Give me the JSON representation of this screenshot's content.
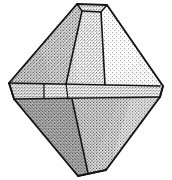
{
  "figure": {
    "title": "Octahedral crystal",
    "caption": "",
    "medium": "engraving",
    "background_color": "#ffffff",
    "ink_color": "#1a1a1a",
    "canvas": {
      "width": 172,
      "height": 180
    }
  },
  "geometry": {
    "description": "Truncated octahedral (bipyramidal) crystal drawn in perspective with a horizontal girdle band.",
    "outline_points": "77,4 107,5 163,86 160,97 106,170 78,176 14,99 9,83",
    "girdle_top_line": "9,83 160,86",
    "girdle_bottom_line": "14,99 160,97",
    "apex_face": "77,4 107,5 101,12 82,11",
    "left_vertex_face": "9,83 14,99",
    "right_vertex_face": "163,86 160,97",
    "bottom_vertex_face": "78,176 106,170",
    "upper_left_edge": "9,83 77,4",
    "upper_right_edge": "107,5 163,86",
    "lower_left_edge": "14,99 78,176",
    "lower_right_edge": "160,97 106,170",
    "upper_ridge_left": "82,11 66,84",
    "upper_ridge_right": "101,12 105,85",
    "lower_ridge_center": "72,99 88,173",
    "inner_left_column": "44,84 44,98"
  },
  "shading": {
    "upper_left_facet": {
      "name": "upper-left-facet",
      "tone": "medium-dark"
    },
    "upper_center_facet": {
      "name": "upper-center-facet",
      "tone": "medium"
    },
    "upper_right_facet": {
      "name": "upper-right-facet",
      "tone": "light"
    },
    "girdle_band": {
      "name": "girdle-band",
      "tone": "medium"
    },
    "lower_left_facet": {
      "name": "lower-left-facet",
      "tone": "dark"
    },
    "lower_center_facet": {
      "name": "lower-center-facet",
      "tone": "dark"
    },
    "lower_right_facet": {
      "name": "lower-right-facet",
      "tone": "light-medium"
    }
  }
}
